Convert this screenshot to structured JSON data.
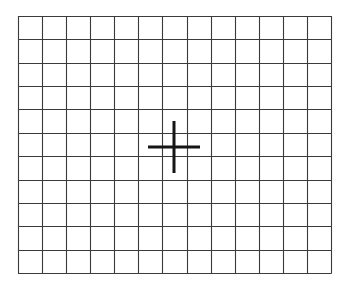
{
  "diagram": {
    "type": "grid-with-crosshair",
    "grid": {
      "columns": 13,
      "rows": 11,
      "left": 18,
      "top": 16,
      "right": 331,
      "bottom": 273,
      "line_color": "#3a3a3a",
      "line_width": 1.1
    },
    "crosshair": {
      "center_x": 174,
      "center_y": 147,
      "half_length": 26,
      "color": "#151515",
      "stroke_width": 3
    }
  }
}
